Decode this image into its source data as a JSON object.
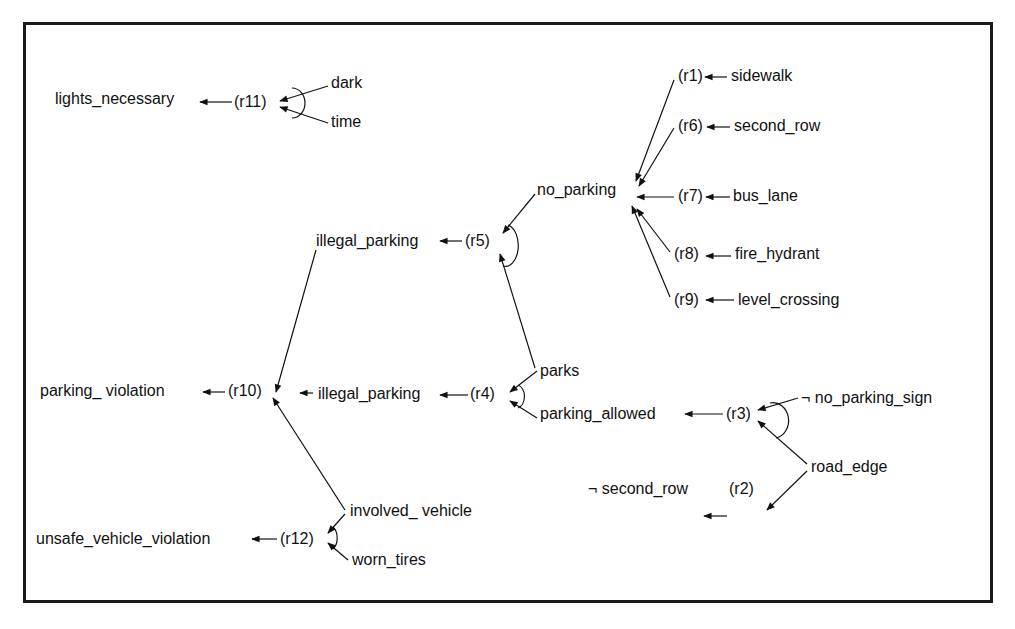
{
  "diagram": {
    "nodes": [
      {
        "id": "lights_necessary",
        "label": "lights_necessary",
        "x": 55,
        "y": 90
      },
      {
        "id": "r11",
        "label": "(r11)",
        "x": 234,
        "y": 93
      },
      {
        "id": "dark",
        "label": "dark",
        "x": 331,
        "y": 74
      },
      {
        "id": "time",
        "label": "time",
        "x": 331,
        "y": 113
      },
      {
        "id": "no_parking",
        "label": "no_parking",
        "x": 537,
        "y": 181
      },
      {
        "id": "r1",
        "label": "(r1)",
        "x": 678,
        "y": 67
      },
      {
        "id": "sidewalk",
        "label": "sidewalk",
        "x": 731,
        "y": 67
      },
      {
        "id": "r6",
        "label": "(r6)",
        "x": 678,
        "y": 117
      },
      {
        "id": "second_row_top",
        "label": "second_row",
        "x": 734,
        "y": 117
      },
      {
        "id": "r7",
        "label": "(r7)",
        "x": 678,
        "y": 187
      },
      {
        "id": "bus_lane",
        "label": "bus_lane",
        "x": 733,
        "y": 187
      },
      {
        "id": "r8",
        "label": "(r8)",
        "x": 674,
        "y": 245
      },
      {
        "id": "fire_hydrant",
        "label": "fire_hydrant",
        "x": 735,
        "y": 245
      },
      {
        "id": "r9",
        "label": "(r9)",
        "x": 674,
        "y": 291
      },
      {
        "id": "level_crossing",
        "label": "level_crossing",
        "x": 738,
        "y": 291
      },
      {
        "id": "illegal_parking_top",
        "label": "illegal_parking",
        "x": 316,
        "y": 232
      },
      {
        "id": "r5",
        "label": "(r5)",
        "x": 465,
        "y": 232
      },
      {
        "id": "parking_violation",
        "label": "parking_ violation",
        "x": 40,
        "y": 382
      },
      {
        "id": "r10",
        "label": "(r10)",
        "x": 228,
        "y": 382
      },
      {
        "id": "illegal_parking_mid",
        "label": "illegal_parking",
        "x": 318,
        "y": 385
      },
      {
        "id": "r4",
        "label": "(r4)",
        "x": 470,
        "y": 385
      },
      {
        "id": "parks",
        "label": "parks",
        "x": 540,
        "y": 362
      },
      {
        "id": "parking_allowed",
        "label": "parking_allowed",
        "x": 540,
        "y": 405
      },
      {
        "id": "r3",
        "label": "(r3)",
        "x": 726,
        "y": 405
      },
      {
        "id": "no_parking_sign",
        "label": "¬  no_parking_sign",
        "x": 801,
        "y": 389
      },
      {
        "id": "road_edge",
        "label": "road_edge",
        "x": 811,
        "y": 458
      },
      {
        "id": "not_second_row",
        "label": "¬ second_row",
        "x": 588,
        "y": 480
      },
      {
        "id": "r2",
        "label": "(r2)",
        "x": 729,
        "y": 480
      },
      {
        "id": "unsafe_vehicle_violation",
        "label": "unsafe_vehicle_violation",
        "x": 36,
        "y": 530
      },
      {
        "id": "r12",
        "label": "(r12)",
        "x": 280,
        "y": 530
      },
      {
        "id": "involved_vehicle",
        "label": "involved_ vehicle",
        "x": 350,
        "y": 502
      },
      {
        "id": "worn_tires",
        "label": "worn_tires",
        "x": 352,
        "y": 551
      }
    ],
    "edges": [
      {
        "from": "r11",
        "to": "lights_necessary",
        "x1": 232,
        "y1": 102,
        "x2": 200,
        "y2": 102
      },
      {
        "from": "dark",
        "to": "r11",
        "x1": 328,
        "y1": 86,
        "x2": 280,
        "y2": 101
      },
      {
        "from": "time",
        "to": "r11",
        "x1": 328,
        "y1": 123,
        "x2": 280,
        "y2": 107
      },
      {
        "from": "sidewalk",
        "to": "r1",
        "x1": 727,
        "y1": 77,
        "x2": 705,
        "y2": 77
      },
      {
        "from": "second_row_top",
        "to": "r6",
        "x1": 730,
        "y1": 127,
        "x2": 707,
        "y2": 127
      },
      {
        "from": "bus_lane",
        "to": "r7",
        "x1": 730,
        "y1": 197,
        "x2": 706,
        "y2": 197
      },
      {
        "from": "fire_hydrant",
        "to": "r8",
        "x1": 731,
        "y1": 256,
        "x2": 706,
        "y2": 256
      },
      {
        "from": "level_crossing",
        "to": "r9",
        "x1": 734,
        "y1": 300,
        "x2": 706,
        "y2": 300
      },
      {
        "from": "r1",
        "to": "no_parking",
        "x1": 674,
        "y1": 80,
        "x2": 636,
        "y2": 181
      },
      {
        "from": "r6",
        "to": "no_parking",
        "x1": 674,
        "y1": 128,
        "x2": 639,
        "y2": 186
      },
      {
        "from": "r7",
        "to": "no_parking",
        "x1": 674,
        "y1": 197,
        "x2": 637,
        "y2": 197
      },
      {
        "from": "r8",
        "to": "no_parking",
        "x1": 670,
        "y1": 252,
        "x2": 637,
        "y2": 209
      },
      {
        "from": "r9",
        "to": "no_parking",
        "x1": 670,
        "y1": 297,
        "x2": 632,
        "y2": 206
      },
      {
        "from": "r5",
        "to": "illegal_parking_top",
        "x1": 462,
        "y1": 241,
        "x2": 440,
        "y2": 241
      },
      {
        "from": "no_parking",
        "to": "r5",
        "x1": 535,
        "y1": 194,
        "x2": 503,
        "y2": 233
      },
      {
        "from": "parks",
        "to": "r5",
        "x1": 535,
        "y1": 368,
        "x2": 500,
        "y2": 254
      },
      {
        "from": "illegal_parking_top",
        "to": "r10",
        "x1": 316,
        "y1": 250,
        "x2": 276,
        "y2": 392
      },
      {
        "from": "r10",
        "to": "parking_violation",
        "x1": 225,
        "y1": 392,
        "x2": 203,
        "y2": 392
      },
      {
        "from": "illegal_parking_mid",
        "to": "r10",
        "x1": 313,
        "y1": 393,
        "x2": 300,
        "y2": 393
      },
      {
        "from": "r4",
        "to": "illegal_parking_mid",
        "x1": 468,
        "y1": 395,
        "x2": 440,
        "y2": 395
      },
      {
        "from": "parks",
        "to": "r4",
        "x1": 537,
        "y1": 371,
        "x2": 510,
        "y2": 392
      },
      {
        "from": "parking_allowed",
        "to": "r4",
        "x1": 537,
        "y1": 418,
        "x2": 510,
        "y2": 401
      },
      {
        "from": "r3",
        "to": "parking_allowed",
        "x1": 723,
        "y1": 414,
        "x2": 685,
        "y2": 414
      },
      {
        "from": "no_parking_sign",
        "to": "r3",
        "x1": 798,
        "y1": 398,
        "x2": 758,
        "y2": 410
      },
      {
        "from": "road_edge",
        "to": "r3",
        "x1": 807,
        "y1": 464,
        "x2": 758,
        "y2": 421
      },
      {
        "from": "road_edge",
        "to": "r2",
        "x1": 807,
        "y1": 471,
        "x2": 767,
        "y2": 510
      },
      {
        "from": "r2",
        "to": "not_second_row",
        "x1": 727,
        "y1": 516,
        "x2": 704,
        "y2": 516
      },
      {
        "from": "involved_vehicle",
        "to": "r10",
        "x1": 345,
        "y1": 510,
        "x2": 273,
        "y2": 398
      },
      {
        "from": "r12",
        "to": "unsafe_vehicle_violation",
        "x1": 277,
        "y1": 539,
        "x2": 252,
        "y2": 539
      },
      {
        "from": "involved_vehicle",
        "to": "r12",
        "x1": 345,
        "y1": 514,
        "x2": 328,
        "y2": 533
      },
      {
        "from": "worn_tires",
        "to": "r12",
        "x1": 348,
        "y1": 560,
        "x2": 328,
        "y2": 543
      }
    ],
    "and_arcs": [
      {
        "rule": "r11",
        "d": "M292 88 A 13 15 0 0 1 292 118"
      },
      {
        "rule": "r5",
        "d": "M508 225 A 11 18 0 0 1 503 266"
      },
      {
        "rule": "r4",
        "d": "M518 385 A 9 12 0 0 1 518 408"
      },
      {
        "rule": "r3",
        "d": "M770 403 A 14 16 0 0 1 776 438"
      },
      {
        "rule": "r12",
        "d": "M333 527 A 9 13 0 0 1 333 549"
      }
    ]
  }
}
